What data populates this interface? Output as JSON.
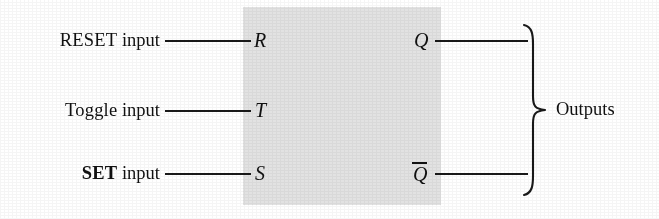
{
  "diagram": {
    "box": {
      "fill_color": "#e2e2e2"
    },
    "line_color": "#1a1a1a",
    "inputs": [
      {
        "label_prefix": "RESET",
        "label_prefix_bold": false,
        "label_suffix": " input",
        "port": "R"
      },
      {
        "label_prefix": "Toggle",
        "label_prefix_bold": false,
        "label_suffix": " input",
        "port": "T"
      },
      {
        "label_prefix": "SET",
        "label_prefix_bold": true,
        "label_suffix": " input",
        "port": "S"
      }
    ],
    "outputs": [
      {
        "port": "Q",
        "overbar": false
      },
      {
        "port": "Q",
        "overbar": true
      }
    ],
    "outputs_group_label": "Outputs"
  }
}
